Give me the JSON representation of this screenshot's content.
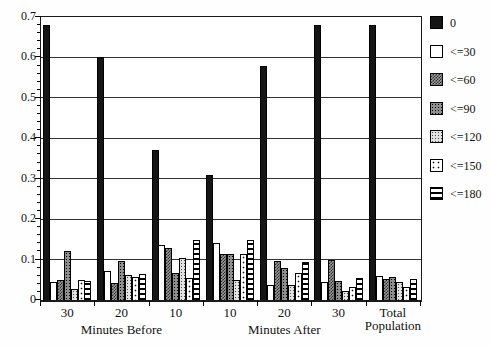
{
  "chart_data": {
    "type": "bar",
    "title": "",
    "xlabel": "",
    "ylabel": "",
    "ylim": [
      0,
      0.7
    ],
    "ytick_step": 0.1,
    "yminor_step": 0.02,
    "grid": true,
    "legend_position": "right",
    "yticks": [
      "0.7",
      "0.6",
      "0.5",
      "0.4",
      "0.3",
      "0.2",
      "0.1",
      "0"
    ],
    "categories": [
      "30",
      "20",
      "10",
      "10",
      "20",
      "30",
      "Total Population"
    ],
    "group_labels": [
      {
        "text": "Minutes Before",
        "under_group_index": 1
      },
      {
        "text": "Minutes After",
        "under_group_index": 4
      }
    ],
    "series": [
      {
        "name": "0",
        "pattern": "solid",
        "values": [
          0.68,
          0.6,
          0.37,
          0.31,
          0.58,
          0.68,
          0.68
        ]
      },
      {
        "name": "<=30",
        "pattern": "white",
        "values": [
          0.044,
          0.072,
          0.135,
          0.14,
          0.038,
          0.045,
          0.059
        ]
      },
      {
        "name": "<=60",
        "pattern": "checker",
        "values": [
          0.049,
          0.042,
          0.128,
          0.115,
          0.097,
          0.098,
          0.051
        ]
      },
      {
        "name": "<=90",
        "pattern": "dotdark",
        "values": [
          0.12,
          0.096,
          0.067,
          0.115,
          0.078,
          0.047,
          0.056
        ]
      },
      {
        "name": "<=120",
        "pattern": "dotmed",
        "values": [
          0.028,
          0.062,
          0.103,
          0.05,
          0.038,
          0.023,
          0.044
        ]
      },
      {
        "name": "<=150",
        "pattern": "dotsparse",
        "values": [
          0.049,
          0.056,
          0.054,
          0.115,
          0.066,
          0.031,
          0.033
        ]
      },
      {
        "name": "<=180",
        "pattern": "hlines",
        "values": [
          0.048,
          0.064,
          0.148,
          0.148,
          0.094,
          0.055,
          0.051
        ]
      }
    ]
  },
  "colors": {
    "bar_black": "#151515",
    "axis": "#000000",
    "background": "#fefefe"
  }
}
